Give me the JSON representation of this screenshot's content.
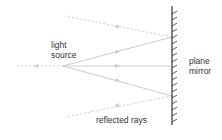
{
  "diagram": {
    "labels": {
      "source_line1": "light",
      "source_line2": "source",
      "mirror_line1": "plane",
      "mirror_line2": "mirror",
      "reflected": "reflected rays"
    },
    "colors": {
      "ray": "#cccccc",
      "virtual_ray": "#cccccc",
      "mirror": "#333333",
      "text": "#333333"
    }
  }
}
